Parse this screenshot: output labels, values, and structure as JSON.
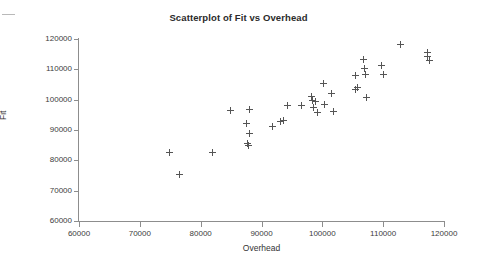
{
  "chart_data": {
    "type": "scatter",
    "title": "Scatterplot of Fit vs Overhead",
    "xlabel": "Overhead",
    "ylabel": "Fit",
    "xlim": [
      60000,
      120000
    ],
    "ylim": [
      60000,
      120000
    ],
    "xticks": [
      "60000",
      "70000",
      "80000",
      "90000",
      "100000",
      "110000",
      "120000"
    ],
    "yticks": [
      "120000",
      "110000",
      "100000",
      "90000",
      "80000",
      "70000",
      "60000"
    ],
    "grid": false,
    "legend": null,
    "marker": "plus",
    "marker_color": "#555555",
    "points": [
      {
        "x": 74800,
        "y": 82700
      },
      {
        "x": 76450,
        "y": 75300
      },
      {
        "x": 81900,
        "y": 82500
      },
      {
        "x": 84850,
        "y": 96400
      },
      {
        "x": 87600,
        "y": 92300
      },
      {
        "x": 87950,
        "y": 96800
      },
      {
        "x": 87650,
        "y": 85600
      },
      {
        "x": 87800,
        "y": 85000
      },
      {
        "x": 88000,
        "y": 88800
      },
      {
        "x": 91750,
        "y": 91300
      },
      {
        "x": 93100,
        "y": 92800
      },
      {
        "x": 93600,
        "y": 93100
      },
      {
        "x": 94250,
        "y": 98100
      },
      {
        "x": 96650,
        "y": 98100
      },
      {
        "x": 98300,
        "y": 101200
      },
      {
        "x": 98450,
        "y": 99600
      },
      {
        "x": 98600,
        "y": 97500
      },
      {
        "x": 98900,
        "y": 99300
      },
      {
        "x": 99150,
        "y": 95900
      },
      {
        "x": 100150,
        "y": 105400
      },
      {
        "x": 100350,
        "y": 98500
      },
      {
        "x": 101500,
        "y": 102000
      },
      {
        "x": 101800,
        "y": 96100
      },
      {
        "x": 105400,
        "y": 107900
      },
      {
        "x": 105500,
        "y": 103500
      },
      {
        "x": 105700,
        "y": 104100
      },
      {
        "x": 106800,
        "y": 113100
      },
      {
        "x": 106900,
        "y": 110300
      },
      {
        "x": 107150,
        "y": 108300
      },
      {
        "x": 107300,
        "y": 100700
      },
      {
        "x": 109800,
        "y": 111400
      },
      {
        "x": 110000,
        "y": 108200
      },
      {
        "x": 112900,
        "y": 118200
      },
      {
        "x": 117300,
        "y": 115400
      },
      {
        "x": 117350,
        "y": 114200
      },
      {
        "x": 117600,
        "y": 112900
      }
    ]
  }
}
